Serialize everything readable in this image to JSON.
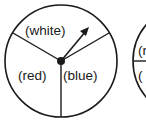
{
  "spinners": [
    {
      "sections": [
        {
          "label": "(white)"
        },
        {
          "label": "(red)"
        },
        {
          "label": "(blue)"
        }
      ],
      "has_arrow": true
    },
    {
      "sections": [
        {
          "label": "(r"
        },
        {
          "label": "("
        }
      ],
      "partial": true
    }
  ],
  "colors": {
    "stroke": "#1a1a1a",
    "background": "#ffffff"
  }
}
